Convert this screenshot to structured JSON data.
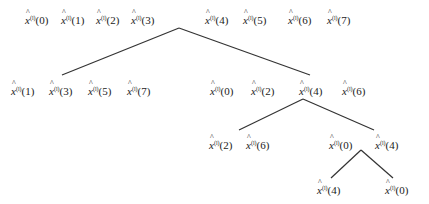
{
  "diagram": {
    "symbol": "x",
    "superscript": "(l)",
    "levels": [
      {
        "name": "level-0",
        "nodes": [
          {
            "group": "root-left",
            "items": [
              "(0)",
              "(1)",
              "(2)",
              "(3)"
            ]
          },
          {
            "group": "root-right",
            "items": [
              "(4)",
              "(5)",
              "(6)",
              "(7)"
            ]
          }
        ]
      },
      {
        "name": "level-1",
        "nodes": [
          {
            "group": "odd",
            "items": [
              "(1)",
              "(3)",
              "(5)",
              "(7)"
            ]
          },
          {
            "group": "even-a",
            "items": [
              "(0)",
              "(2)"
            ]
          },
          {
            "group": "even-b",
            "items": [
              "(4)",
              "(6)"
            ]
          }
        ]
      },
      {
        "name": "level-2",
        "nodes": [
          {
            "group": "a",
            "items": [
              "(2)",
              "(6)"
            ]
          },
          {
            "group": "b",
            "items": [
              "(0)"
            ]
          },
          {
            "group": "c",
            "items": [
              "(4)"
            ]
          }
        ]
      },
      {
        "name": "level-3",
        "nodes": [
          {
            "group": "a",
            "items": [
              "(4)"
            ]
          },
          {
            "group": "b",
            "items": [
              "(0)"
            ]
          }
        ]
      }
    ]
  }
}
